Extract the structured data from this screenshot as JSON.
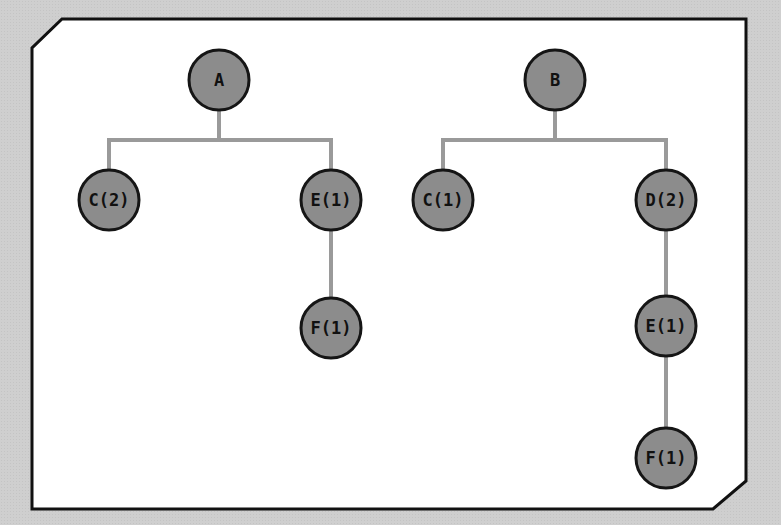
{
  "colors": {
    "background": "#cfcfcf",
    "panel": "#ffffff",
    "panel_border": "#111111",
    "node_fill": "#8c8c8c",
    "node_stroke": "#151515",
    "edge": "#9a9a9a"
  },
  "trees": [
    {
      "name": "tree-a",
      "root": "A",
      "nodes": [
        {
          "id": "a-root",
          "label": "A",
          "x": 219,
          "y": 80
        },
        {
          "id": "a-c",
          "label": "C(2)",
          "x": 109,
          "y": 200
        },
        {
          "id": "a-e",
          "label": "E(1)",
          "x": 331,
          "y": 200
        },
        {
          "id": "a-f",
          "label": "F(1)",
          "x": 331,
          "y": 328
        }
      ],
      "edges": [
        [
          "A",
          "C(2)"
        ],
        [
          "A",
          "E(1)"
        ],
        [
          "E(1)",
          "F(1)"
        ]
      ]
    },
    {
      "name": "tree-b",
      "root": "B",
      "nodes": [
        {
          "id": "b-root",
          "label": "B",
          "x": 555,
          "y": 80
        },
        {
          "id": "b-c",
          "label": "C(1)",
          "x": 443,
          "y": 200
        },
        {
          "id": "b-d",
          "label": "D(2)",
          "x": 666,
          "y": 200
        },
        {
          "id": "b-e",
          "label": "E(1)",
          "x": 666,
          "y": 326
        },
        {
          "id": "b-f",
          "label": "F(1)",
          "x": 666,
          "y": 458
        }
      ],
      "edges": [
        [
          "B",
          "C(1)"
        ],
        [
          "B",
          "D(2)"
        ],
        [
          "D(2)",
          "E(1)"
        ],
        [
          "E(1)",
          "F(1)"
        ]
      ]
    }
  ]
}
